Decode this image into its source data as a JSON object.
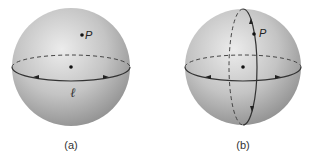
{
  "figures": [
    {
      "id": "a",
      "caption": "(a)",
      "point_label": "P",
      "line_label": "ℓ",
      "description": "Sphere with one great circle (equator) through the center; point P not on the line"
    },
    {
      "id": "b",
      "caption": "(b)",
      "point_label": "P",
      "description": "Sphere with equator great circle and a second great circle through P perpendicular to it"
    }
  ],
  "colors": {
    "sphere_light": "#ededed",
    "sphere_dark": "#8f8f8f",
    "line": "#333333"
  }
}
